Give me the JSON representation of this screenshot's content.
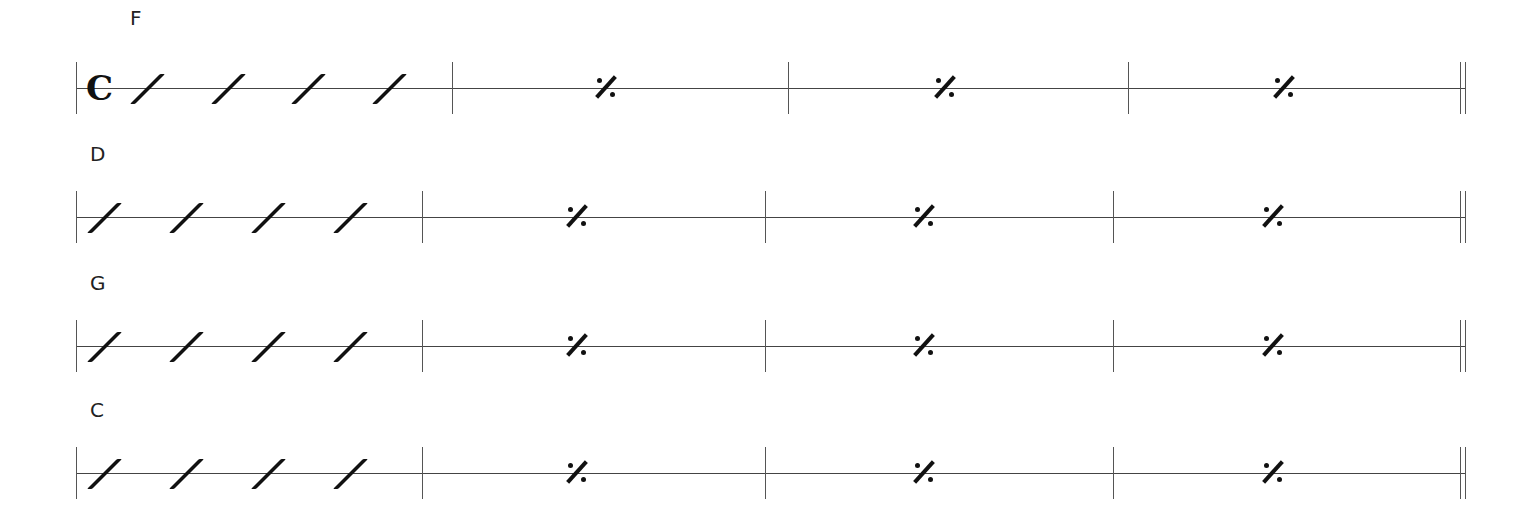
{
  "score": {
    "time_signature": "𝄴",
    "time_signature_name": "common time",
    "systems": [
      {
        "chord": "F",
        "staff_y": 88,
        "clef": true,
        "start_x": 76,
        "bars_x": [
          452,
          788,
          1128
        ],
        "end_x": 1460,
        "slash_x": [
          147,
          228,
          308,
          389
        ],
        "repeat_x": [
          606,
          945,
          1284
        ]
      },
      {
        "chord": "D",
        "staff_y": 217,
        "clef": false,
        "start_x": 76,
        "bars_x": [
          422,
          765,
          1113
        ],
        "end_x": 1460,
        "slash_x": [
          104,
          186,
          268,
          350
        ],
        "repeat_x": [
          577,
          924,
          1273
        ]
      },
      {
        "chord": "G",
        "staff_y": 346,
        "clef": false,
        "start_x": 76,
        "bars_x": [
          422,
          765,
          1113
        ],
        "end_x": 1460,
        "slash_x": [
          104,
          186,
          268,
          350
        ],
        "repeat_x": [
          577,
          924,
          1273
        ]
      },
      {
        "chord": "C",
        "staff_y": 473,
        "clef": false,
        "start_x": 76,
        "bars_x": [
          422,
          765,
          1113
        ],
        "end_x": 1460,
        "slash_x": [
          104,
          186,
          268,
          350
        ],
        "repeat_x": [
          577,
          924,
          1273
        ]
      }
    ],
    "chord_labels": [
      "F",
      "D",
      "G",
      "C"
    ],
    "measure_repeat_symbol": "measure-repeat",
    "slash_symbol": "rhythm-slash"
  }
}
